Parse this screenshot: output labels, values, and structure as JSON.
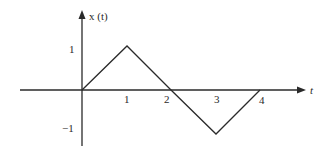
{
  "diagram": {
    "type": "signal-plot",
    "y_axis_label": "x (t)",
    "x_axis_label": "t",
    "x_ticks": [
      "1",
      "2",
      "3",
      "4"
    ],
    "y_ticks": [
      "1",
      "−1"
    ],
    "signal_points": [
      {
        "t": 0,
        "x": 0
      },
      {
        "t": 1,
        "x": 1
      },
      {
        "t": 2,
        "x": 0
      },
      {
        "t": 3,
        "x": -1
      },
      {
        "t": 4,
        "x": 0
      }
    ],
    "colors": {
      "line": "#2a2a2a",
      "background": "#ffffff"
    }
  }
}
